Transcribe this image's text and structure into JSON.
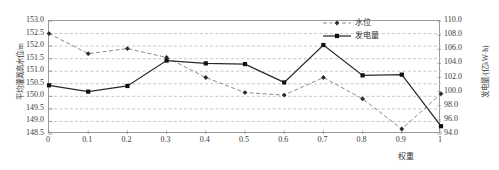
{
  "chart_data": {
    "type": "line",
    "title": "",
    "xlabel": "权重",
    "ylabel": "平均灌溉高水位/m",
    "y2label": "发电量/(亿kW·h)",
    "x": [
      0,
      0.1,
      0.2,
      0.3,
      0.4,
      0.5,
      0.6,
      0.7,
      0.8,
      0.9,
      1
    ],
    "xtick_labels": [
      "0",
      "0.1",
      "0.2",
      "0.3",
      "0.4",
      "0.5",
      "0.6",
      "0.7",
      "0.8",
      "0.9",
      "1"
    ],
    "xlim": [
      0,
      1
    ],
    "ylim": [
      148.5,
      153.0
    ],
    "ytick_labels": [
      "153.0",
      "152.5",
      "152.0",
      "151.5",
      "151.0",
      "150.5",
      "150.0",
      "149.5",
      "149.0",
      "148.5"
    ],
    "ytick_values": [
      153.0,
      152.5,
      152.0,
      151.5,
      151.0,
      150.5,
      150.0,
      149.5,
      149.0,
      148.5
    ],
    "y2lim": [
      94.0,
      110.0
    ],
    "y2tick_labels": [
      "110.0",
      "108.0",
      "106.0",
      "104.0",
      "102.0",
      "100.0",
      "98.0",
      "96.0",
      "94.0"
    ],
    "y2tick_values": [
      110.0,
      108.0,
      106.0,
      104.0,
      102.0,
      100.0,
      98.0,
      96.0,
      94.0
    ],
    "grid": true,
    "legend_position": "top-right",
    "series": [
      {
        "name": "水位",
        "axis": "left",
        "style": "dashed",
        "marker": "diamond",
        "color": "#7d7d7d",
        "values": [
          152.5,
          151.7,
          151.9,
          151.55,
          150.75,
          150.15,
          150.05,
          150.75,
          149.9,
          148.7,
          150.1
        ]
      },
      {
        "name": "发电量",
        "axis": "right",
        "style": "solid",
        "marker": "square",
        "color": "#2b2b2b",
        "values": [
          100.9,
          100.0,
          100.8,
          104.4,
          104.0,
          103.9,
          101.3,
          106.6,
          102.3,
          102.4,
          95.1
        ]
      }
    ]
  },
  "legend": {
    "items": [
      {
        "label": "水位"
      },
      {
        "label": "发电量"
      }
    ]
  }
}
